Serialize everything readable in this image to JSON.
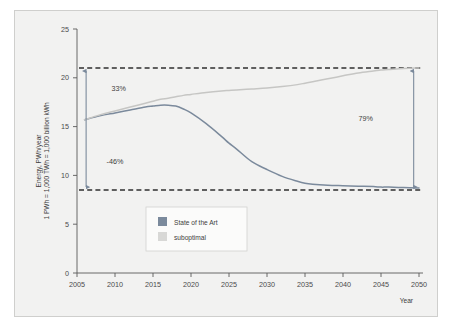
{
  "chart_data": {
    "type": "line",
    "title": "",
    "xlabel": "Year",
    "ylabel_line1": "Energy, PWh/year",
    "ylabel_line2": "1 PWh = 1,000 TWh = 1,000 billion kWh",
    "xlim": [
      2005,
      2050
    ],
    "ylim": [
      0,
      25
    ],
    "yticks": [
      0,
      5,
      10,
      15,
      20,
      25
    ],
    "ytick_labels": [
      "0",
      "5",
      "10",
      "15",
      "20",
      "25"
    ],
    "xticks": [
      2005,
      2010,
      2015,
      2020,
      2025,
      2030,
      2035,
      2040,
      2045,
      2050
    ],
    "xtick_labels": [
      "2005",
      "2010",
      "2015",
      "2020",
      "2025",
      "2030",
      "2035",
      "2040",
      "2045",
      "2050"
    ],
    "grid": false,
    "legend_position": "center-left-lower",
    "x": [
      2006,
      2008,
      2010,
      2012,
      2014,
      2015,
      2016,
      2017,
      2018,
      2019,
      2020,
      2022,
      2024,
      2025,
      2026,
      2028,
      2030,
      2032,
      2034,
      2035,
      2036,
      2038,
      2040,
      2042,
      2044,
      2045,
      2046,
      2048,
      2050
    ],
    "series": [
      {
        "name": "State of the Art",
        "color": "#7b8a9c",
        "values": [
          15.7,
          16.1,
          16.4,
          16.7,
          17.0,
          17.1,
          17.2,
          17.2,
          17.1,
          16.8,
          16.4,
          15.3,
          14.0,
          13.3,
          12.7,
          11.4,
          10.6,
          9.9,
          9.4,
          9.2,
          9.1,
          9.0,
          8.95,
          8.9,
          8.85,
          8.8,
          8.8,
          8.75,
          8.7
        ]
      },
      {
        "name": "suboptimal",
        "color": "#c6c6c4",
        "values": [
          15.7,
          16.2,
          16.6,
          17.0,
          17.4,
          17.6,
          17.8,
          17.9,
          18.05,
          18.2,
          18.3,
          18.5,
          18.65,
          18.7,
          18.75,
          18.85,
          18.95,
          19.1,
          19.3,
          19.45,
          19.6,
          19.9,
          20.2,
          20.5,
          20.7,
          20.8,
          20.85,
          20.95,
          21.0
        ]
      }
    ],
    "reference_lines": [
      {
        "name": "upper-dashed",
        "y": 21.0,
        "style": "dashed",
        "color": "#2f2f2f"
      },
      {
        "name": "lower-dashed",
        "y": 8.5,
        "style": "dashed",
        "color": "#2f2f2f"
      }
    ],
    "annotations": [
      {
        "name": "growth-upper-left",
        "text": "33%",
        "x": 2010.5,
        "y": 18.6
      },
      {
        "name": "reduction-lower-left",
        "text": "-46%",
        "x": 2010.0,
        "y": 11.2
      },
      {
        "name": "gap-right",
        "text": "79%",
        "x": 2043.0,
        "y": 15.6
      }
    ],
    "arrows": [
      {
        "name": "left-range-arrow",
        "x": 2006.2,
        "y_from": 8.5,
        "y_to": 21.0,
        "double_headed": true
      },
      {
        "name": "right-range-arrow",
        "x": 2049.3,
        "y_from": 8.5,
        "y_to": 21.0,
        "double_headed": true
      }
    ],
    "legend": [
      {
        "label": "State of the Art",
        "color": "#7b8a9c"
      },
      {
        "label": "suboptimal",
        "color": "#d8d8d6"
      }
    ]
  },
  "colors": {
    "panel_background": "#f2f2f1",
    "panel_border": "#cfcfcd",
    "axis": "#5a5a5a",
    "text": "#3d3d3d",
    "state_of_the_art": "#7b8a9c",
    "suboptimal": "#c6c6c4",
    "dashed": "#2f2f2f"
  }
}
